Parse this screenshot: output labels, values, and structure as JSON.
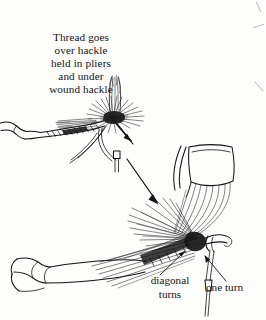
{
  "figure": {
    "kind": "pen-and-ink instructional line drawing",
    "background_color": "#fdfdfc",
    "ink_color": "#151515",
    "width": 266,
    "height": 320
  },
  "caption": {
    "lines": [
      "Thread goes",
      "over hackle",
      "held in pliers",
      "and under",
      "wound hackle"
    ]
  },
  "labels": {
    "diagonal_turns": {
      "lines": [
        "diagonal",
        "turns"
      ]
    },
    "one_turn": {
      "text": "one turn"
    }
  },
  "elements": {
    "upper_fly": "fly on hook with wound hackle collar, wing plume and hackle pliers",
    "lower_fly": "enlarged fly with hackle feather gripped by pliers above, bobbin thread below",
    "connector_arrow": "long arrow from upper figure to lower figure",
    "thread_arrow": "short arrow showing thread direction at upper fly",
    "pliers": "hackle pliers jaw gripping feather stem",
    "bobbin": "bobbin holder weight hanging on thread"
  }
}
